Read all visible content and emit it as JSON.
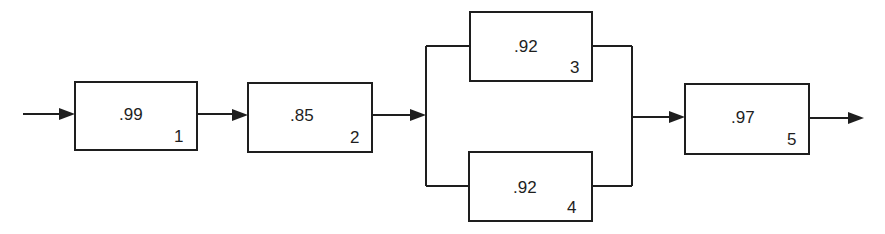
{
  "diagram": {
    "type": "reliability-block-diagram",
    "components": [
      {
        "id": "1",
        "reliability": ".99",
        "index_label": "1"
      },
      {
        "id": "2",
        "reliability": ".85",
        "index_label": "2"
      },
      {
        "id": "3",
        "reliability": ".92",
        "index_label": "3"
      },
      {
        "id": "4",
        "reliability": ".92",
        "index_label": "4"
      },
      {
        "id": "5",
        "reliability": ".97",
        "index_label": "5"
      }
    ],
    "structure": "1 -> 2 -> (3 || 4) -> 5",
    "colors": {
      "stroke": "#1e1e1e",
      "background": "#ffffff"
    }
  }
}
